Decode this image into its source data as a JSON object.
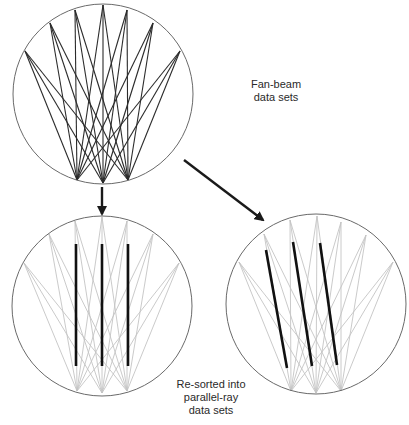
{
  "labels": {
    "fan_beam": [
      "Fan-beam",
      "data sets"
    ],
    "resorted": [
      "Re-sorted into",
      "parallel-ray",
      "data sets"
    ]
  },
  "colors": {
    "circle": "#6a6a6a",
    "fan_dark": "#2b2b2b",
    "fan_light": "#c4c4c4",
    "highlight": "#111111",
    "arrow": "#1a1a1a"
  },
  "circles": [
    {
      "name": "fan-beam-circle",
      "cx": 103,
      "cy": 94,
      "r": 90,
      "sources": [
        [
          25,
          51
        ],
        [
          50,
          23
        ],
        [
          75,
          10
        ],
        [
          103,
          5
        ],
        [
          127,
          10
        ],
        [
          153,
          23
        ],
        [
          180,
          51
        ]
      ],
      "detectors": [
        [
          77,
          180
        ],
        [
          103,
          183
        ],
        [
          128,
          180
        ]
      ],
      "fan_style": "dark",
      "highlights": []
    },
    {
      "name": "parallel-vertical-circle",
      "cx": 102,
      "cy": 306,
      "r": 90,
      "sources": [
        [
          24,
          263
        ],
        [
          49,
          234
        ],
        [
          75,
          221
        ],
        [
          102,
          217
        ],
        [
          127,
          221
        ],
        [
          153,
          234
        ],
        [
          179,
          263
        ]
      ],
      "detectors": [
        [
          77,
          391
        ],
        [
          102,
          393
        ],
        [
          127,
          391
        ]
      ],
      "fan_style": "light",
      "highlights": [
        [
          [
            76,
            244
          ],
          [
            76,
            366
          ]
        ],
        [
          [
            102,
            244
          ],
          [
            102,
            366
          ]
        ],
        [
          [
            128,
            244
          ],
          [
            128,
            366
          ]
        ]
      ]
    },
    {
      "name": "parallel-oblique-circle",
      "cx": 316,
      "cy": 304,
      "r": 90,
      "sources": [
        [
          239,
          262
        ],
        [
          264,
          234
        ],
        [
          290,
          220
        ],
        [
          317,
          216
        ],
        [
          341,
          222
        ],
        [
          366,
          235
        ],
        [
          393,
          262
        ]
      ],
      "detectors": [
        [
          291,
          391
        ],
        [
          316,
          393
        ],
        [
          341,
          391
        ]
      ],
      "fan_style": "light",
      "highlights": [
        [
          [
            266,
            250
          ],
          [
            287,
            368
          ]
        ],
        [
          [
            293,
            242
          ],
          [
            312,
            366
          ]
        ],
        [
          [
            320,
            243
          ],
          [
            337,
            365
          ]
        ]
      ]
    }
  ],
  "arrows": [
    {
      "name": "down-arrow",
      "from": [
        102,
        187
      ],
      "to": [
        102,
        214
      ]
    },
    {
      "name": "diagonal-arrow",
      "from": [
        184,
        160
      ],
      "to": [
        263,
        220
      ]
    }
  ]
}
